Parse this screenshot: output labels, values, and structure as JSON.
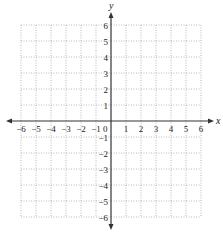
{
  "diagram": {
    "type": "coordinate-plane",
    "x_axis": {
      "label": "x",
      "min": -6,
      "max": 6,
      "ticks": [
        "−6",
        "−5",
        "−4",
        "−3",
        "−2",
        "−1",
        "1",
        "2",
        "3",
        "4",
        "5",
        "6"
      ],
      "tick_values": [
        -6,
        -5,
        -4,
        -3,
        -2,
        -1,
        1,
        2,
        3,
        4,
        5,
        6
      ]
    },
    "y_axis": {
      "label": "y",
      "min": -6,
      "max": 6,
      "ticks": [
        "6",
        "5",
        "4",
        "3",
        "2",
        "1",
        "−1",
        "−2",
        "−3",
        "−4",
        "−5",
        "−6"
      ],
      "tick_values": [
        6,
        5,
        4,
        3,
        2,
        1,
        -1,
        -2,
        -3,
        -4,
        -5,
        -6
      ]
    },
    "origin_label": "0",
    "grid": {
      "style": "dotted",
      "step": 1
    },
    "colors": {
      "axis": "#333333",
      "grid": "#aaaaaa",
      "text": "#222222",
      "background": "#ffffff"
    }
  }
}
